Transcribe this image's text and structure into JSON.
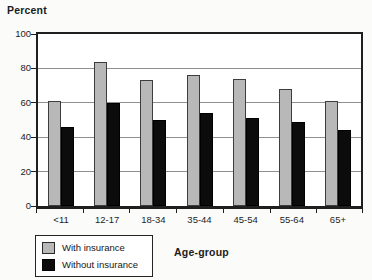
{
  "title": "Percent",
  "x_axis_title": "Age-group",
  "legend": {
    "with_label": "With insurance",
    "without_label": "Without insurance"
  },
  "colors": {
    "with_fill": "#b8b8b8",
    "with_border": "#3d3d3d",
    "without_fill": "#0c0c0c",
    "gridline": "#8f8f8f",
    "plot_border": "#1f1f1f",
    "background": "#ffffff"
  },
  "chart_data": {
    "type": "bar",
    "categories": [
      "<11",
      "12-17",
      "18-34",
      "35-44",
      "45-54",
      "55-64",
      "65+"
    ],
    "series": [
      {
        "name": "With insurance",
        "color": "#b8b8b8",
        "values": [
          61,
          84,
          73,
          76,
          74,
          68,
          61
        ]
      },
      {
        "name": "Without insurance",
        "color": "#0c0c0c",
        "values": [
          46,
          60,
          50,
          54,
          51,
          49,
          44
        ]
      }
    ],
    "title": "Percent",
    "xlabel": "Age-group",
    "ylabel": "Percent",
    "ylim": [
      0,
      100
    ],
    "yticks": [
      0,
      20,
      40,
      60,
      80,
      100
    ],
    "grid": true,
    "legend_position": "bottom-left",
    "bar_width_px": 13,
    "grouping": "paired, no gap within pair"
  }
}
